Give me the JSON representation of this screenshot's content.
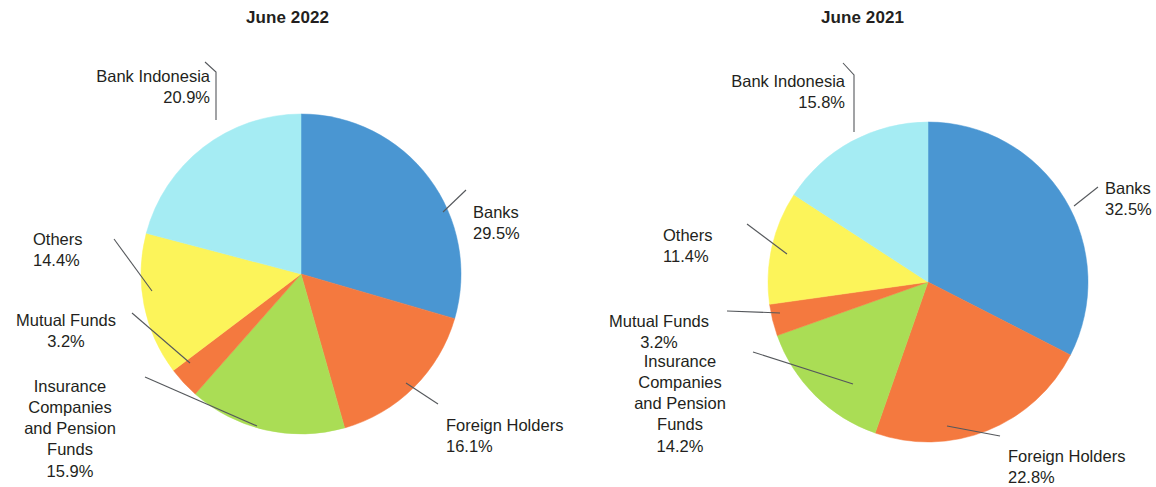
{
  "figure": {
    "panels": [
      {
        "id": "june-2022",
        "title": "June 2022",
        "slices": [
          {
            "label": "Banks",
            "pct_label": "29.5%",
            "value": 29.5,
            "color": "#4a96d2"
          },
          {
            "label": "Foreign Holders",
            "pct_label": "16.1%",
            "value": 16.1,
            "color": "#f4793f"
          },
          {
            "label": "Insurance\nCompanies\nand Pension\nFunds",
            "pct_label": "15.9%",
            "value": 15.9,
            "color": "#aadd55"
          },
          {
            "label": "Mutual Funds",
            "pct_label": "3.2%",
            "value": 3.2,
            "color": "#f4793f"
          },
          {
            "label": "Others",
            "pct_label": "14.4%",
            "value": 14.4,
            "color": "#fcf45a"
          },
          {
            "label": "Bank Indonesia",
            "pct_label": "20.9%",
            "value": 20.9,
            "color": "#a5ecf3"
          }
        ]
      },
      {
        "id": "june-2021",
        "title": "June 2021",
        "slices": [
          {
            "label": "Banks",
            "pct_label": "32.5%",
            "value": 32.5,
            "color": "#4a96d2"
          },
          {
            "label": "Foreign Holders",
            "pct_label": "22.8%",
            "value": 22.8,
            "color": "#f4793f"
          },
          {
            "label": "Insurance\nCompanies\nand Pension\nFunds",
            "pct_label": "14.2%",
            "value": 14.2,
            "color": "#aadd55"
          },
          {
            "label": "Mutual Funds",
            "pct_label": "3.2%",
            "value": 3.2,
            "color": "#f4793f"
          },
          {
            "label": "Others",
            "pct_label": "11.4%",
            "value": 11.4,
            "color": "#fcf45a"
          },
          {
            "label": "Bank Indonesia",
            "pct_label": "15.8%",
            "value": 15.8,
            "color": "#a5ecf3"
          }
        ]
      }
    ]
  },
  "chart_data": [
    {
      "type": "pie",
      "title": "June 2022",
      "categories": [
        "Banks",
        "Foreign Holders",
        "Insurance Companies and Pension Funds",
        "Mutual Funds",
        "Others",
        "Bank Indonesia"
      ],
      "values": [
        29.5,
        16.1,
        15.9,
        3.2,
        14.4,
        20.9
      ],
      "value_labels": [
        "29.5%",
        "16.1%",
        "15.9%",
        "3.2%",
        "14.4%",
        "20.9%"
      ],
      "colors": [
        "#4a96d2",
        "#f4793f",
        "#aadd55",
        "#f4793f",
        "#fcf45a",
        "#a5ecf3"
      ],
      "units": "percent",
      "start_angle_deg": 0,
      "direction": "clockwise",
      "legend": "none",
      "labels_position": "outside-with-leader-lines",
      "grid": false
    },
    {
      "type": "pie",
      "title": "June 2021",
      "categories": [
        "Banks",
        "Foreign Holders",
        "Insurance Companies and Pension Funds",
        "Mutual Funds",
        "Others",
        "Bank Indonesia"
      ],
      "values": [
        32.5,
        22.8,
        14.2,
        3.2,
        11.4,
        15.8
      ],
      "value_labels": [
        "32.5%",
        "22.8%",
        "14.2%",
        "3.2%",
        "11.4%",
        "15.8%"
      ],
      "colors": [
        "#4a96d2",
        "#f4793f",
        "#aadd55",
        "#f4793f",
        "#fcf45a",
        "#a5ecf3"
      ],
      "units": "percent",
      "start_angle_deg": 0,
      "direction": "clockwise",
      "legend": "none",
      "labels_position": "outside-with-leader-lines",
      "grid": false
    }
  ]
}
